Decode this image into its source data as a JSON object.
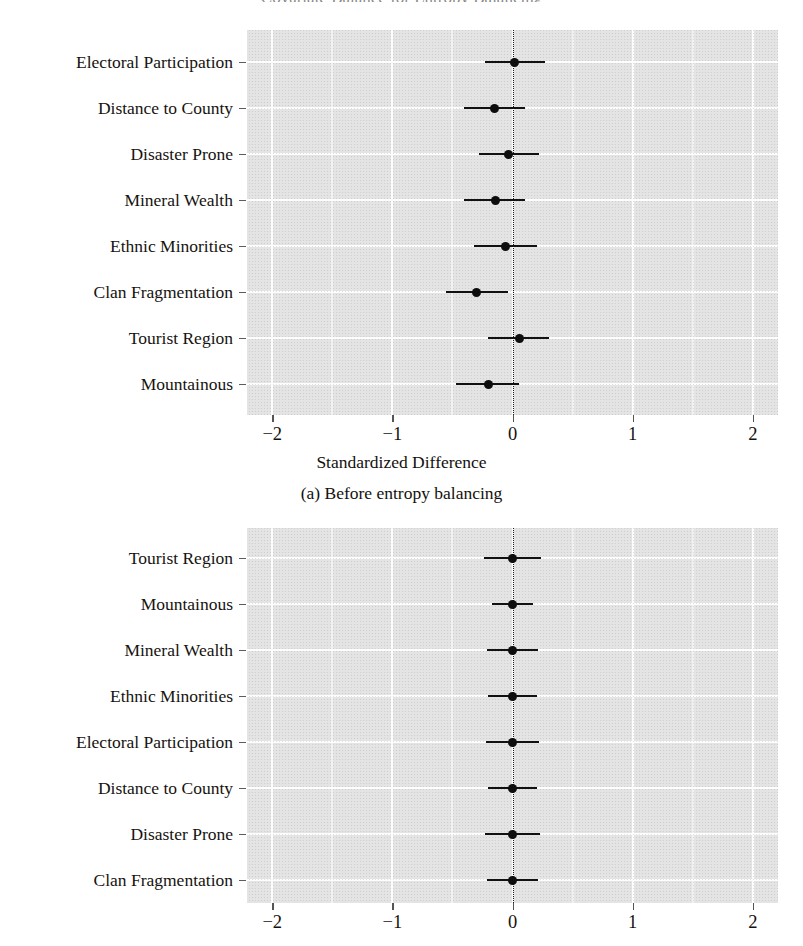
{
  "figure": {
    "title": "Covariate Balance for Entropy Balancing",
    "xlabel": "Standardized Difference",
    "subcaption_a": "(a) Before entropy balancing"
  },
  "axis": {
    "ticks": [
      "−2",
      "−1",
      "0",
      "1",
      "2"
    ],
    "tick_values": [
      -2,
      -1,
      0,
      1,
      2
    ],
    "xlim": [
      -2.21,
      2.21
    ]
  },
  "colors": {
    "panel_background": "#e4e4e4",
    "gridline": "#fdfdfd",
    "point": "#0d0d0d",
    "zeroline": "#1a1a1a",
    "text": "#15130f"
  },
  "chart_data": [
    {
      "type": "scatter",
      "panel": "a",
      "title": "(a) Before entropy balancing",
      "xlabel": "Standardized Difference",
      "ylabel": "",
      "xlim": [
        -2.21,
        2.21
      ],
      "xticks": [
        -2,
        -1,
        0,
        1,
        2
      ],
      "grid": true,
      "reference_line": 0,
      "categories": [
        "Electoral Participation",
        "Distance to County",
        "Disaster Prone",
        "Mineral Wealth",
        "Ethnic Minorities",
        "Clan Fragmentation",
        "Tourist Region",
        "Mountainous"
      ],
      "values": [
        0.02,
        -0.15,
        -0.03,
        -0.14,
        -0.06,
        -0.3,
        0.06,
        -0.2
      ],
      "ci_low": [
        -0.23,
        -0.4,
        -0.28,
        -0.4,
        -0.32,
        -0.55,
        -0.2,
        -0.47
      ],
      "ci_high": [
        0.27,
        0.1,
        0.22,
        0.1,
        0.2,
        -0.04,
        0.3,
        0.05
      ]
    },
    {
      "type": "scatter",
      "panel": "b",
      "title": "",
      "xlabel": "",
      "ylabel": "",
      "xlim": [
        -2.21,
        2.21
      ],
      "xticks": [
        -2,
        -1,
        0,
        1,
        2
      ],
      "grid": true,
      "reference_line": 0,
      "categories": [
        "Tourist Region",
        "Mountainous",
        "Mineral Wealth",
        "Ethnic Minorities",
        "Electoral Participation",
        "Distance to County",
        "Disaster Prone",
        "Clan Fragmentation"
      ],
      "values": [
        0.0,
        0.0,
        0.0,
        0.0,
        0.0,
        0.0,
        0.0,
        0.0
      ],
      "ci_low": [
        -0.24,
        -0.17,
        -0.21,
        -0.2,
        -0.22,
        -0.2,
        -0.23,
        -0.21
      ],
      "ci_high": [
        0.24,
        0.17,
        0.21,
        0.2,
        0.22,
        0.2,
        0.23,
        0.21
      ]
    }
  ]
}
